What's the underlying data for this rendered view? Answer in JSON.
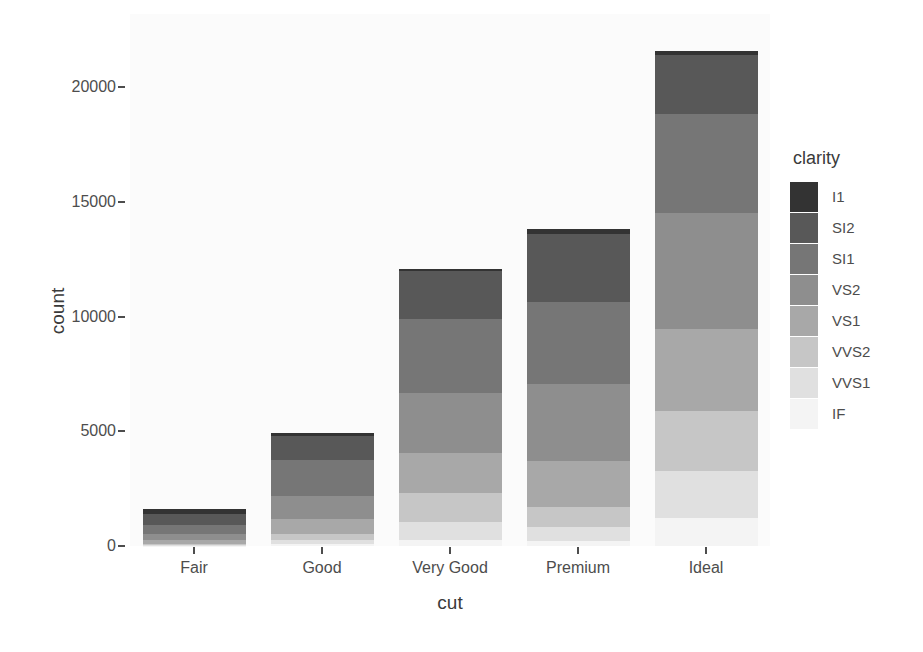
{
  "chart_data": {
    "type": "bar",
    "stacked": true,
    "title": "",
    "xlabel": "cut",
    "ylabel": "count",
    "categories": [
      "Fair",
      "Good",
      "Very Good",
      "Premium",
      "Ideal"
    ],
    "legend_title": "clarity",
    "legend_position": "right",
    "grid": false,
    "ylim": [
      0,
      23000
    ],
    "yticks": [
      0,
      5000,
      10000,
      15000,
      20000
    ],
    "ytick_labels": [
      "0",
      "5000",
      "10000",
      "15000",
      "20000"
    ],
    "series": [
      {
        "name": "I1",
        "color": "#333333",
        "values": [
          210,
          96,
          84,
          205,
          146
        ]
      },
      {
        "name": "SI2",
        "color": "#585858",
        "values": [
          466,
          1081,
          2100,
          2949,
          2598
        ]
      },
      {
        "name": "SI1",
        "color": "#767676",
        "values": [
          408,
          1560,
          3240,
          3575,
          4282
        ]
      },
      {
        "name": "VS2",
        "color": "#8e8e8e",
        "values": [
          261,
          978,
          2591,
          3357,
          5071
        ]
      },
      {
        "name": "VS1",
        "color": "#a8a8a8",
        "values": [
          170,
          648,
          1775,
          1989,
          3589
        ]
      },
      {
        "name": "VVS2",
        "color": "#c6c6c6",
        "values": [
          69,
          286,
          1235,
          870,
          2606
        ]
      },
      {
        "name": "VVS1",
        "color": "#e0e0e0",
        "values": [
          17,
          186,
          789,
          616,
          2047
        ]
      },
      {
        "name": "IF",
        "color": "#f4f4f4",
        "values": [
          9,
          71,
          268,
          230,
          1212
        ]
      }
    ],
    "totals": [
      1610,
      4906,
      12082,
      13791,
      21551
    ],
    "panel_background": "#fbfbfb",
    "axis_text_color": "#4d4d4d"
  },
  "axis": {
    "x_title": "cut",
    "y_title": "count"
  },
  "legend": {
    "title": "clarity"
  }
}
